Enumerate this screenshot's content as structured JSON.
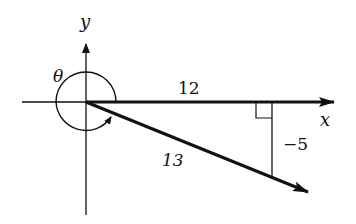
{
  "diagram": {
    "type": "reference-angle-triangle",
    "axes": {
      "x_label": "x",
      "y_label": "y"
    },
    "angle": {
      "label": "θ",
      "direction": "clockwise-from-positive-x",
      "description": "nearly full rotation ending in quadrant IV"
    },
    "triangle": {
      "adjacent_label": "12",
      "opposite_label": "−5",
      "hypotenuse_label": "13",
      "right_angle_marker": true
    },
    "colors": {
      "ink": "#111111",
      "background": "#ffffff"
    }
  }
}
